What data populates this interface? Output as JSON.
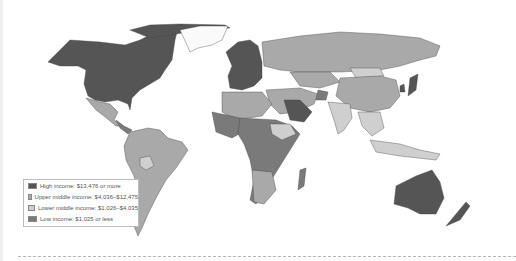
{
  "map": {
    "title": "World income levels",
    "colors": {
      "high": "#555555",
      "upper_middle": "#a9a9a9",
      "lower_middle": "#cfcfcf",
      "low": "#7a7a7a",
      "ocean": "#ffffff",
      "border": "#444444"
    }
  },
  "legend": {
    "items": [
      {
        "label": "High income: $13,476 or more",
        "color": "#555555"
      },
      {
        "label": "Upper middle income: $4,036–$12,475",
        "color": "#a9a9a9"
      },
      {
        "label": "Lower middle income: $1,026–$4,035",
        "color": "#cfcfcf"
      },
      {
        "label": "Low income: $1,025 or less",
        "color": "#7a7a7a"
      }
    ]
  }
}
